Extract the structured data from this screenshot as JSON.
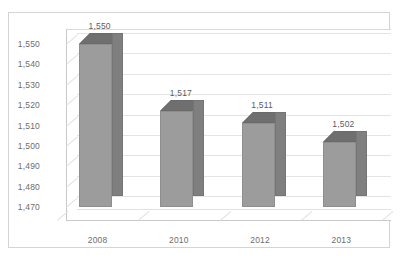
{
  "chart_data": {
    "type": "bar",
    "title": "",
    "subtitle": "",
    "xlabel": "",
    "ylabel": "",
    "categories": [
      "2008",
      "2010",
      "2012",
      "2013"
    ],
    "values": [
      1550,
      1517,
      1511,
      1502
    ],
    "data_labels": [
      "1,550",
      "1,517",
      "1,511",
      "1,502"
    ],
    "ylim": [
      1470,
      1550
    ],
    "ytick_step": 10,
    "ytick_labels": [
      "1,550",
      "1,540",
      "1,530",
      "1,520",
      "1,510",
      "1,500",
      "1,490",
      "1,480",
      "1,470"
    ],
    "ytick_values": [
      1550,
      1540,
      1530,
      1520,
      1510,
      1500,
      1490,
      1480,
      1470
    ],
    "grid": true,
    "legend": false,
    "legend_position": "none",
    "three_d": true,
    "series": [
      {
        "name": "",
        "values": [
          1550,
          1517,
          1511,
          1502
        ]
      }
    ],
    "colors": {
      "bar_front": "#9c9c9c",
      "bar_side": "#7f7f7f",
      "bar_top": "#6f6f6f",
      "gridline": "#e4e4e4",
      "axis": "#c9c9c9",
      "text": "#6d6d6d",
      "frame": "#d4d4d4",
      "background": "#ffffff"
    }
  }
}
